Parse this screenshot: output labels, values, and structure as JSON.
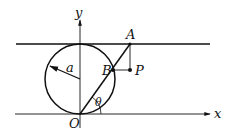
{
  "diagram": {
    "type": "geometry-figure",
    "labels": {
      "y_axis": "y",
      "x_axis": "x",
      "origin": "O",
      "point_a": "A",
      "point_b": "B",
      "point_p": "P",
      "radius": "a",
      "angle": "θ"
    },
    "colors": {
      "stroke": "#111111",
      "background": "#ffffff"
    },
    "elements": [
      "circle of radius a tangent to x-axis at O and to horizontal line at top",
      "horizontal tangent line y = 2a",
      "line from O through B to A at angle θ",
      "vertical segment from A down to P",
      "horizontal segment from B to P"
    ]
  }
}
